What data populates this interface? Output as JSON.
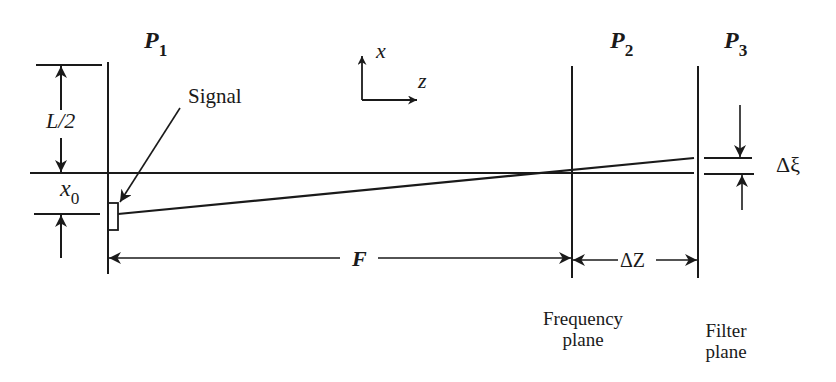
{
  "diagram": {
    "type": "optical-system-schematic",
    "planes": [
      {
        "id": "P1",
        "label": "P",
        "subscript": "1"
      },
      {
        "id": "P2",
        "label": "P",
        "subscript": "2",
        "caption_line1": "Frequency",
        "caption_line2": "plane"
      },
      {
        "id": "P3",
        "label": "P",
        "subscript": "3",
        "caption_line1": "Filter",
        "caption_line2": "plane"
      }
    ],
    "axes": {
      "x_label": "x",
      "z_label": "z"
    },
    "dimensions": {
      "half_aperture": "L/2",
      "offset": "x",
      "offset_subscript": "0",
      "focal_length": "F",
      "plane_separation": "ΔZ",
      "shift": "Δξ"
    },
    "annotations": {
      "signal": "Signal"
    },
    "colors": {
      "ink": "#1a1a1a",
      "background": "#ffffff"
    }
  }
}
